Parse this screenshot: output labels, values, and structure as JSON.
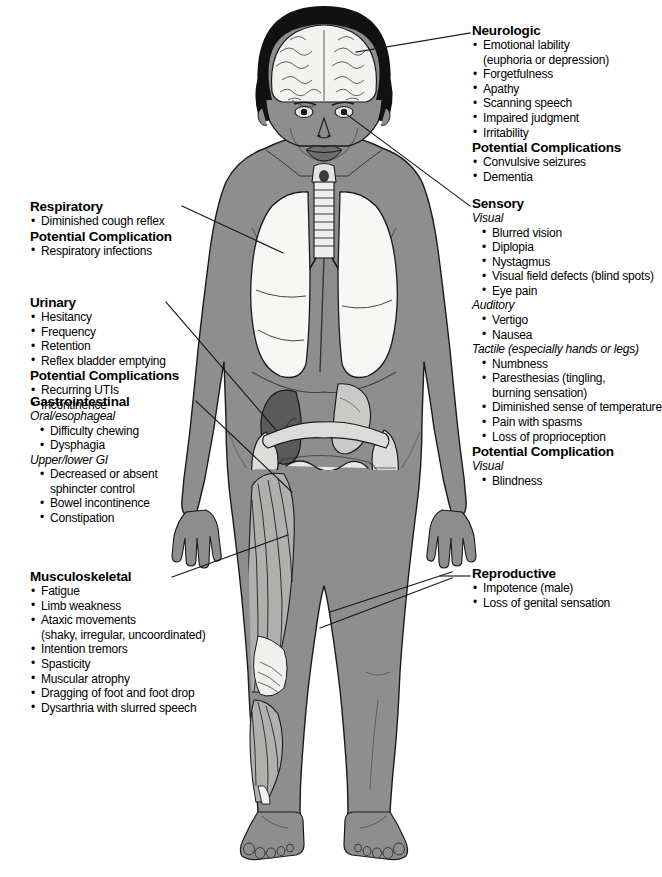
{
  "diagram": {
    "colors": {
      "skin": "#8e8e8e",
      "skin_shadow": "#787878",
      "hair": "#111111",
      "organ_light": "#f2f2f0",
      "organ_mid": "#c9c9c7",
      "kidney_dark": "#5a5a5a",
      "muscle": "#b0b0ae",
      "outline": "#1a1a1a",
      "leader_line": "#1a1a1a",
      "background": "#ffffff"
    },
    "anatomy_labels": [
      "brain",
      "eyes",
      "larynx",
      "trachea",
      "lungs",
      "diaphragm",
      "kidney",
      "stomach",
      "large-intestine",
      "small-intestine",
      "bladder",
      "thigh-muscles",
      "knee-tendons",
      "calf-muscles"
    ]
  },
  "callouts": {
    "neurologic": {
      "title": "Neurologic",
      "items": [
        {
          "text": "Emotional lability",
          "bullet": true
        },
        {
          "text": "(euphoria or depression)",
          "bullet": false
        },
        {
          "text": "Forgetfulness",
          "bullet": true
        },
        {
          "text": "Apathy",
          "bullet": true
        },
        {
          "text": "Scanning speech",
          "bullet": true
        },
        {
          "text": "Impaired judgment",
          "bullet": true
        },
        {
          "text": "Irritability",
          "bullet": true
        }
      ],
      "complications_title": "Potential Complications",
      "complications": [
        {
          "text": "Convulsive seizures",
          "bullet": true
        },
        {
          "text": "Dementia",
          "bullet": true
        }
      ]
    },
    "sensory": {
      "title": "Sensory",
      "groups": [
        {
          "subhead": "Visual",
          "items": [
            {
              "text": "Blurred vision",
              "bullet": true
            },
            {
              "text": "Diplopia",
              "bullet": true
            },
            {
              "text": "Nystagmus",
              "bullet": true
            },
            {
              "text": "Visual field defects (blind spots)",
              "bullet": true
            },
            {
              "text": "Eye pain",
              "bullet": true
            }
          ]
        },
        {
          "subhead": "Auditory",
          "items": [
            {
              "text": "Vertigo",
              "bullet": true
            },
            {
              "text": "Nausea",
              "bullet": true
            }
          ]
        },
        {
          "subhead": "Tactile (especially hands or legs)",
          "items": [
            {
              "text": "Numbness",
              "bullet": true
            },
            {
              "text": "Paresthesias (tingling,",
              "bullet": true
            },
            {
              "text": "burning sensation)",
              "bullet": false
            },
            {
              "text": "Diminished sense of temperature",
              "bullet": true
            },
            {
              "text": "Pain with spasms",
              "bullet": true
            },
            {
              "text": "Loss of proprioception",
              "bullet": true
            }
          ]
        }
      ],
      "complications_title": "Potential Complication",
      "complications_subhead": "Visual",
      "complications": [
        {
          "text": "Blindness",
          "bullet": true
        }
      ]
    },
    "respiratory": {
      "title": "Respiratory",
      "items": [
        {
          "text": "Diminished cough reflex",
          "bullet": true
        }
      ],
      "complications_title": "Potential Complication",
      "complications": [
        {
          "text": "Respiratory infections",
          "bullet": true
        }
      ]
    },
    "urinary": {
      "title": "Urinary",
      "items": [
        {
          "text": "Hesitancy",
          "bullet": true
        },
        {
          "text": "Frequency",
          "bullet": true
        },
        {
          "text": "Retention",
          "bullet": true
        },
        {
          "text": "Reflex bladder emptying",
          "bullet": true
        }
      ],
      "complications_title": "Potential Complications",
      "complications": [
        {
          "text": "Recurring UTIs",
          "bullet": true
        },
        {
          "text": "Incontinence",
          "bullet": true
        }
      ]
    },
    "gastrointestinal": {
      "title": "Gastrointestinal",
      "groups": [
        {
          "subhead": "Oral/esophageal",
          "items": [
            {
              "text": "Difficulty chewing",
              "bullet": true
            },
            {
              "text": "Dysphagia",
              "bullet": true
            }
          ]
        },
        {
          "subhead": "Upper/lower GI",
          "items": [
            {
              "text": "Decreased or absent",
              "bullet": true
            },
            {
              "text": "sphincter control",
              "bullet": false
            },
            {
              "text": "Bowel incontinence",
              "bullet": true
            },
            {
              "text": "Constipation",
              "bullet": true
            }
          ]
        }
      ]
    },
    "musculoskeletal": {
      "title": "Musculoskeletal",
      "items": [
        {
          "text": "Fatigue",
          "bullet": true
        },
        {
          "text": "Limb weakness",
          "bullet": true
        },
        {
          "text": "Ataxic movements",
          "bullet": true
        },
        {
          "text": "(shaky, irregular, uncoordinated)",
          "bullet": false
        },
        {
          "text": "Intention tremors",
          "bullet": true
        },
        {
          "text": "Spasticity",
          "bullet": true
        },
        {
          "text": "Muscular atrophy",
          "bullet": true
        },
        {
          "text": "Dragging of foot and foot drop",
          "bullet": true
        },
        {
          "text": "Dysarthria with slurred speech",
          "bullet": true
        }
      ]
    },
    "reproductive": {
      "title": "Reproductive",
      "items": [
        {
          "text": "Impotence (male)",
          "bullet": true
        },
        {
          "text": "Loss of genital sensation",
          "bullet": true
        }
      ]
    }
  }
}
